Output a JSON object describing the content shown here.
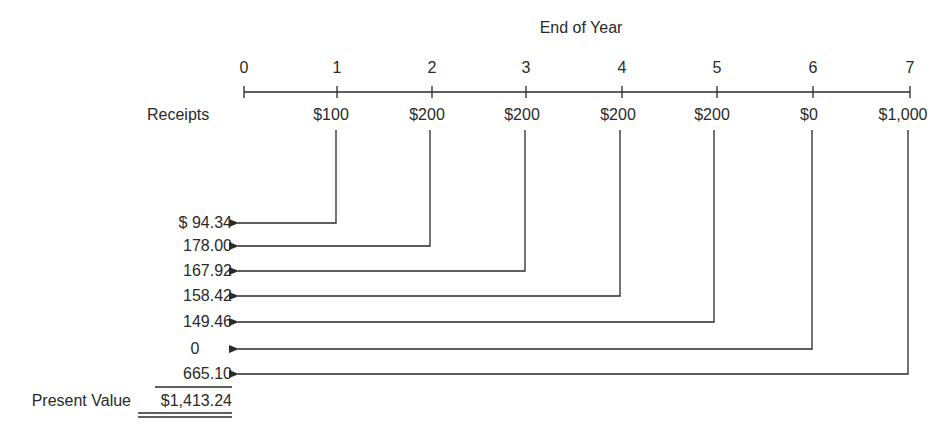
{
  "header": {
    "title": "End of Year"
  },
  "timeline": {
    "years": [
      "0",
      "1",
      "2",
      "3",
      "4",
      "5",
      "6",
      "7"
    ],
    "row_label": "Receipts",
    "receipts": [
      "",
      "$100",
      "$200",
      "$200",
      "$200",
      "$200",
      "$0",
      "$1,000"
    ]
  },
  "present_values": {
    "items": [
      "$ 94.34",
      "178.00",
      "167.92",
      "158.42",
      "149.46",
      "0",
      "665.10"
    ],
    "total_label": "Present Value",
    "total_value": "$1,413.24"
  },
  "colors": {
    "ink": "#2a2a2a",
    "background": "#ffffff"
  }
}
